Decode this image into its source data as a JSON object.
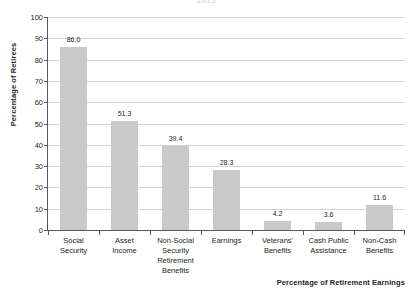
{
  "chart_data": {
    "type": "bar",
    "title": "2012",
    "xlabel": "Percentage of Retirement Earnings",
    "ylabel": "Percentage of Retirees",
    "ylim": [
      0,
      100
    ],
    "ytick_step": 10,
    "yticks": [
      "100",
      "90",
      "80",
      "70",
      "60",
      "50",
      "40",
      "30",
      "20",
      "10",
      "0"
    ],
    "grid": true,
    "legend": "none",
    "bar_color": "#c9c9c9",
    "axis_color": "#58595b",
    "grid_color": "#d3d3d3",
    "categories": [
      "Social Security",
      "Asset Income",
      "Non-Social Security Retirement Benefits",
      "Earnings",
      "Veterans' Benefits",
      "Cash Public Assistance",
      "Non-Cash Benefits"
    ],
    "category_lines": [
      [
        "Social",
        "Security"
      ],
      [
        "Asset",
        "Income"
      ],
      [
        "Non-Social",
        "Security",
        "Retirement",
        "Benefits"
      ],
      [
        "Earnings"
      ],
      [
        "Veterans'",
        "Benefits"
      ],
      [
        "Cash Public",
        "Assistance"
      ],
      [
        "Non-Cash",
        "Benefits"
      ]
    ],
    "values": [
      86.0,
      51.3,
      39.4,
      28.3,
      4.2,
      3.6,
      11.6
    ],
    "value_labels": [
      "86.0",
      "51.3",
      "39.4",
      "28.3",
      "4.2",
      "3.6",
      "11.6"
    ]
  }
}
